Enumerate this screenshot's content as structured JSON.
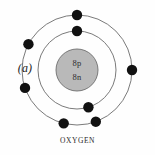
{
  "figure": {
    "panel_label": "(a)",
    "caption": "OXYGEN",
    "element_name": "Oxygen",
    "background_color": "#fefefe"
  },
  "nucleus": {
    "proton_label": "8p",
    "neutron_label": "8n",
    "protons": 8,
    "neutrons": 8,
    "fill_color": "#b9b9b9",
    "stroke_color": "#6e6e6e",
    "center_x": 77,
    "center_y": 70,
    "radius": 21
  },
  "shells": [
    {
      "name": "inner-shell",
      "index": 1,
      "radius": 39,
      "stroke_color": "#6b6b6b",
      "electron_count": 2,
      "electron_angles_deg": [
        90,
        287
      ]
    },
    {
      "name": "outer-shell",
      "index": 2,
      "radius": 55,
      "stroke_color": "#6b6b6b",
      "electron_count": 6,
      "electron_angles_deg": [
        90,
        152,
        199,
        0,
        256,
        290
      ]
    }
  ],
  "electron": {
    "fill_color": "#111111",
    "radius": 5.2,
    "total_count": 8
  }
}
